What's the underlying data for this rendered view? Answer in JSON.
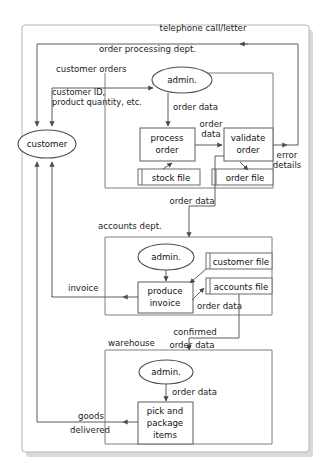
{
  "diagram": {
    "type": "data-flow-diagram",
    "external_entity": {
      "label": "customer"
    },
    "containers": [
      {
        "id": "order-processing",
        "label": "order processing dept."
      },
      {
        "id": "accounts",
        "label": "accounts dept."
      },
      {
        "id": "warehouse",
        "label": "warehouse"
      }
    ],
    "processes": [
      {
        "id": "admin-order",
        "label": "admin.",
        "shape": "ellipse"
      },
      {
        "id": "process-order",
        "label_line1": "process",
        "label_line2": "order",
        "shape": "rect"
      },
      {
        "id": "validate-order",
        "label_line1": "validate",
        "label_line2": "order",
        "shape": "rect"
      },
      {
        "id": "admin-accounts",
        "label": "admin.",
        "shape": "ellipse"
      },
      {
        "id": "produce-invoice",
        "label_line1": "produce",
        "label_line2": "invoice",
        "shape": "rect"
      },
      {
        "id": "admin-warehouse",
        "label": "admin.",
        "shape": "ellipse"
      },
      {
        "id": "pick-package",
        "label_line1": "pick and",
        "label_line2": "package",
        "label_line3": "items",
        "shape": "rect"
      }
    ],
    "data_stores": [
      {
        "id": "stock-file",
        "label": "stock file"
      },
      {
        "id": "order-file",
        "label": "order file"
      },
      {
        "id": "customer-file",
        "label": "customer file"
      },
      {
        "id": "accounts-file",
        "label": "accounts file"
      }
    ],
    "flows": [
      {
        "id": "telephone-call-letter",
        "label": "telephone call/letter"
      },
      {
        "id": "customer-orders",
        "label": "customer orders"
      },
      {
        "id": "customer-id-line1",
        "label": "customer ID,"
      },
      {
        "id": "customer-id-line2",
        "label": "product quantity, etc."
      },
      {
        "id": "order-data-admin",
        "label": "order data"
      },
      {
        "id": "order-data-process-line1",
        "label": "order"
      },
      {
        "id": "order-data-process-line2",
        "label": "data"
      },
      {
        "id": "error-details-line1",
        "label": "error"
      },
      {
        "id": "error-details-line2",
        "label": "details"
      },
      {
        "id": "order-data-to-accounts",
        "label": "order data"
      },
      {
        "id": "invoice",
        "label": "invoice"
      },
      {
        "id": "order-data-accounts",
        "label": "order data"
      },
      {
        "id": "confirmed",
        "label": "confirmed"
      },
      {
        "id": "order-data-warehouse",
        "label": "order data"
      },
      {
        "id": "order-data-pick",
        "label": "order data"
      },
      {
        "id": "goods-line1",
        "label": "goods"
      },
      {
        "id": "goods-line2",
        "label": "delivered"
      }
    ],
    "colors": {
      "line": "#5d5d5d",
      "container": "#7e7e7e",
      "node_stroke": "#6b6b6b",
      "text": "#1b1b1b",
      "page_border": "#b4b4b4",
      "shadow": "#d9d9d6",
      "background": "#ffffff"
    }
  }
}
